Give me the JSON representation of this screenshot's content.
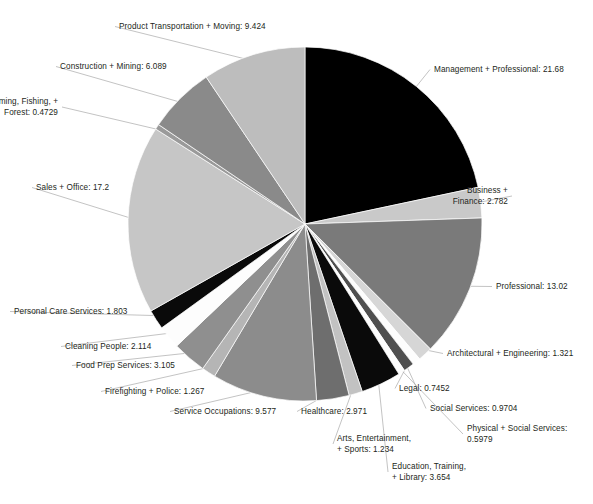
{
  "chart_data": {
    "type": "pie",
    "title": "",
    "subtitle": "",
    "xlabel": "",
    "ylabel": "",
    "units": "percent",
    "legend_position": "none",
    "label_format": "{name}: {value}",
    "grid": false,
    "start_angle_deg": 0,
    "direction": "clockwise",
    "total": 100.0,
    "categories": [
      "Management + Professional",
      "Business + Finance",
      "Professional",
      "Architectural + Engineering",
      "Legal",
      "Social Services",
      "Physical + Social Services",
      "Education, Training, + Library",
      "Arts, Entertainment, + Sports",
      "Healthcare",
      "Service Occupations",
      "Firefighting + Police",
      "Food Prep Services",
      "Cleaning People",
      "Personal Care Services",
      "Sales + Office",
      "Farming, Fishing, + Forest",
      "Construction + Mining",
      "Product Transportation + Moving"
    ],
    "values": [
      21.68,
      2.782,
      13.02,
      1.321,
      0.7452,
      0.9704,
      0.5979,
      3.654,
      1.234,
      2.971,
      9.577,
      1.267,
      3.105,
      2.114,
      1.803,
      17.2,
      0.4729,
      6.089,
      9.424
    ],
    "value_labels": [
      "21.68",
      "2.782",
      "13.02",
      "1.321",
      "0.7452",
      "0.9704",
      "0.5979",
      "3.654",
      "1.234",
      "2.971",
      "9.577",
      "1.267",
      "3.105",
      "2.114",
      "1.803",
      "17.2",
      "0.4729",
      "6.089",
      "9.424"
    ],
    "colors": [
      "#000000",
      "#c9c9c9",
      "#7a7a7a",
      "#d6d6d6",
      "#fdfdfd",
      "#4f4f4f",
      "#fdfdfd",
      "#0a0a0a",
      "#c2c2c2",
      "#6e6e6e",
      "#8c8c8c",
      "#b5b5b5",
      "#8f8f8f",
      "#fdfdfd",
      "#0a0a0a",
      "#c6c6c6",
      "#9a9a9a",
      "#8a8a8a",
      "#bdbdbd"
    ]
  },
  "labels": [
    {
      "name": "product-transportation-moving",
      "text": "Product Transportation + Moving: 9.424",
      "align": "left",
      "x": 119,
      "y": 21
    },
    {
      "name": "construction-mining",
      "text": "Construction + Mining: 6.089",
      "align": "left",
      "x": 60,
      "y": 61
    },
    {
      "name": "farming-fishing-forest",
      "text": "Farming, Fishing, +\nForest: 0.4729",
      "align": "right",
      "x": 58,
      "y": 96
    },
    {
      "name": "sales-office",
      "text": "Sales + Office: 17.2",
      "align": "left",
      "x": 36,
      "y": 182
    },
    {
      "name": "personal-care-services",
      "text": "Personal Care Services: 1.803",
      "align": "left",
      "x": 14,
      "y": 306
    },
    {
      "name": "cleaning-people",
      "text": "Cleaning People: 2.114",
      "align": "left",
      "x": 65,
      "y": 341
    },
    {
      "name": "food-prep-services",
      "text": "Food Prep Services: 3.105",
      "align": "left",
      "x": 76,
      "y": 360
    },
    {
      "name": "firefighting-police",
      "text": "Firefighting + Police: 1.267",
      "align": "left",
      "x": 105,
      "y": 386
    },
    {
      "name": "service-occupations",
      "text": "Service Occupations: 9.577",
      "align": "left",
      "x": 174,
      "y": 406
    },
    {
      "name": "healthcare",
      "text": "Healthcare: 2.971",
      "align": "left",
      "x": 301,
      "y": 406
    },
    {
      "name": "arts-entertainment-sports",
      "text": "Arts, Entertainment,\n+ Sports: 1.234",
      "align": "left",
      "x": 337,
      "y": 433
    },
    {
      "name": "education-training-library",
      "text": "Education, Training,\n+ Library: 3.654",
      "align": "left",
      "x": 392,
      "y": 461
    },
    {
      "name": "management-professional",
      "text": "Management + Professional: 21.68",
      "align": "left",
      "x": 434,
      "y": 64
    },
    {
      "name": "business-finance",
      "text": "Business +\nFinance: 2.782",
      "align": "right",
      "x": 508,
      "y": 185
    },
    {
      "name": "professional",
      "text": "Professional: 13.02",
      "align": "left",
      "x": 496,
      "y": 281
    },
    {
      "name": "architectural-engineering",
      "text": "Architectural + Engineering: 1.321",
      "align": "left",
      "x": 447,
      "y": 348
    },
    {
      "name": "legal",
      "text": "Legal: 0.7452",
      "align": "left",
      "x": 399,
      "y": 383
    },
    {
      "name": "social-services",
      "text": "Social Services: 0.9704",
      "align": "left",
      "x": 430,
      "y": 403
    },
    {
      "name": "physical-social-services",
      "text": "Physical + Social Services:\n0.5979",
      "align": "left",
      "x": 467,
      "y": 423
    }
  ]
}
